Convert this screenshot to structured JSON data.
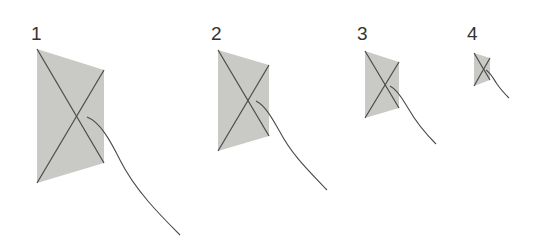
{
  "colors": {
    "background": "#ffffff",
    "kite_fill": "#c9c9c5",
    "line": "#4a4a4a",
    "label": "#333333"
  },
  "kites": [
    {
      "label": "1",
      "label_pos": [
        31,
        24
      ],
      "quad": [
        [
          37,
          49
        ],
        [
          104,
          70
        ],
        [
          104,
          163
        ],
        [
          37,
          183
        ]
      ],
      "cross": [
        87,
        117
      ],
      "string": "M87,117 C100,122 110,140 120,160 C135,190 160,215 180,235"
    },
    {
      "label": "2",
      "label_pos": [
        211,
        24
      ],
      "quad": [
        [
          218,
          50
        ],
        [
          269,
          65
        ],
        [
          269,
          136
        ],
        [
          218,
          151
        ]
      ],
      "cross": [
        256,
        101
      ],
      "string": "M256,101 C266,106 273,120 280,132 C292,155 310,172 327,190"
    },
    {
      "label": "3",
      "label_pos": [
        357,
        24
      ],
      "quad": [
        [
          365,
          51
        ],
        [
          399,
          62
        ],
        [
          399,
          108
        ],
        [
          365,
          118
        ]
      ],
      "cross": [
        390,
        86
      ],
      "string": "M390,86 C398,90 403,100 408,108 C416,122 425,133 436,144"
    },
    {
      "label": "4",
      "label_pos": [
        467,
        24
      ],
      "quad": [
        [
          474,
          53
        ],
        [
          490,
          58
        ],
        [
          490,
          80
        ],
        [
          474,
          86
        ]
      ],
      "cross": [
        486,
        70
      ],
      "string": "M486,70 C491,73 494,80 497,84 C501,90 505,94 509,98"
    }
  ]
}
